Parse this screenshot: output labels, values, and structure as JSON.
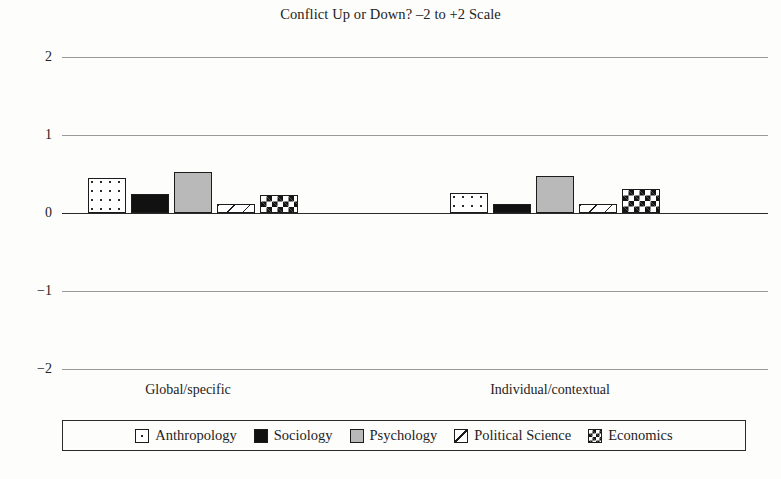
{
  "chart_data": {
    "type": "bar",
    "title": "Conflict Up or Down? –2 to +2 Scale",
    "xlabel": "",
    "ylabel": "",
    "ylim": [
      -2,
      2
    ],
    "yticks": [
      "2",
      "1",
      "0",
      "−1",
      "−2"
    ],
    "ytick_values": [
      2,
      1,
      0,
      -1,
      -2
    ],
    "grid": true,
    "legend_position": "bottom",
    "categories": [
      "Global/specific",
      "Individual/contextual"
    ],
    "series": [
      {
        "name": "Anthropology",
        "pattern": "dots",
        "values": [
          0.45,
          0.26
        ]
      },
      {
        "name": "Sociology",
        "pattern": "solid",
        "values": [
          0.24,
          0.11
        ]
      },
      {
        "name": "Psychology",
        "pattern": "gray",
        "values": [
          0.52,
          0.48
        ]
      },
      {
        "name": "Political Science",
        "pattern": "diag",
        "values": [
          0.11,
          0.12
        ]
      },
      {
        "name": "Economics",
        "pattern": "check",
        "values": [
          0.23,
          0.31
        ]
      }
    ]
  },
  "colors": {
    "background": "#fdfdfb",
    "text": "#232323",
    "gridline": "#9a9a9a",
    "zeroline": "#2a2a2a",
    "bar_outline": "#1c1c1c",
    "solid_fill": "#111111",
    "gray_fill": "#b9b9b9"
  }
}
